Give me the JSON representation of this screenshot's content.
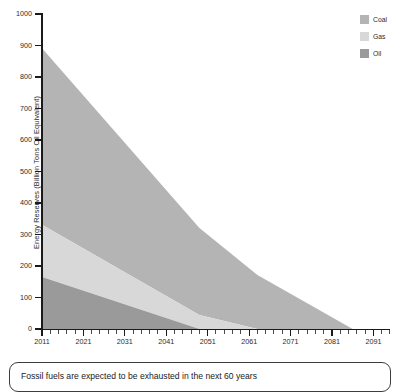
{
  "chart_data": {
    "type": "area",
    "stacked": true,
    "title": "",
    "xlabel": "",
    "ylabel": "Energy Reserves (Billion Tons Oil Equivalent)",
    "xlim": [
      2011,
      2095
    ],
    "ylim": [
      0,
      1000
    ],
    "grid": false,
    "legend_position": "top-right",
    "x_tick_labels": [
      "2011",
      "2021",
      "2031",
      "2041",
      "2051",
      "2061",
      "2071",
      "2081",
      "2091"
    ],
    "x_tick_values": [
      2011,
      2021,
      2031,
      2041,
      2051,
      2061,
      2071,
      2081,
      2091
    ],
    "x_minor_tick_interval": 2,
    "y_tick_labels": [
      "0",
      "100",
      "200",
      "300",
      "400",
      "500",
      "600",
      "700",
      "800",
      "900",
      "1000"
    ],
    "y_tick_values": [
      0,
      100,
      200,
      300,
      400,
      500,
      600,
      700,
      800,
      900,
      1000
    ],
    "series": [
      {
        "name": "Oil",
        "color": "#9a9a9a",
        "x": [
          2011,
          2088
        ],
        "values": [
          165,
          0
        ],
        "depletion_year": 2049
      },
      {
        "name": "Gas",
        "color": "#d8d8d8",
        "x": [
          2011,
          2088
        ],
        "values": [
          166,
          0
        ],
        "depletion_year": 2063
      },
      {
        "name": "Coal",
        "color": "#b4b4b4",
        "x": [
          2011,
          2088
        ],
        "values": [
          560,
          0
        ],
        "depletion_year": 2086
      }
    ],
    "stack_tops_2011": {
      "oil": 165,
      "oil_plus_gas": 331,
      "total": 891
    },
    "annotations": []
  },
  "legend": {
    "items": [
      {
        "label": "Coal",
        "color": "#b4b4b4"
      },
      {
        "label": "Gas",
        "color": "#d8d8d8"
      },
      {
        "label": "Oil",
        "color": "#9a9a9a"
      }
    ]
  },
  "caption": {
    "text": "Fossil fuels are expected to be exhausted in the next 60 years"
  }
}
